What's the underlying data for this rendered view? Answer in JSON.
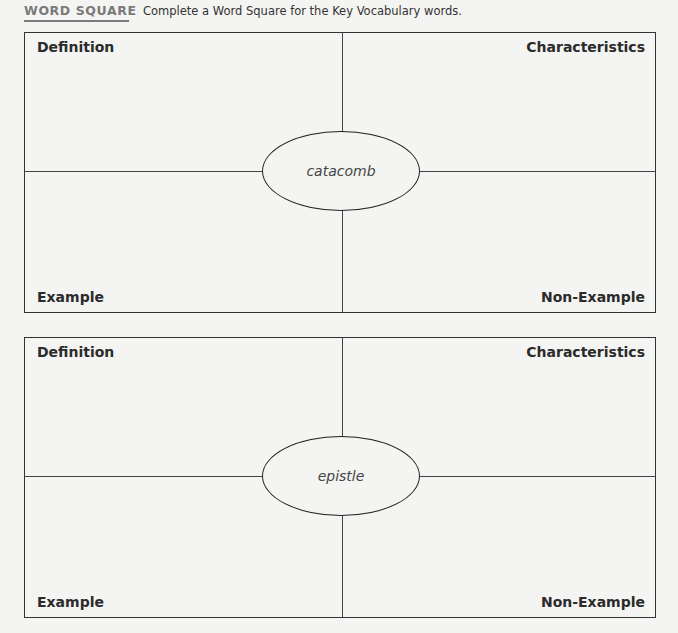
{
  "header": {
    "tag": "WORD SQUARE",
    "instruction": "Complete a Word Square for the Key Vocabulary words."
  },
  "word_squares": [
    {
      "word": "catacomb",
      "quadrants": {
        "top_left": "Definition",
        "top_right": "Characteristics",
        "bottom_left": "Example",
        "bottom_right": "Non-Example"
      }
    },
    {
      "word": "epistle",
      "quadrants": {
        "top_left": "Definition",
        "top_right": "Characteristics",
        "bottom_left": "Example",
        "bottom_right": "Non-Example"
      }
    }
  ],
  "colors": {
    "background": "#f4f4f2",
    "tag_gray": "#7a7a7a",
    "line": "#333333"
  }
}
